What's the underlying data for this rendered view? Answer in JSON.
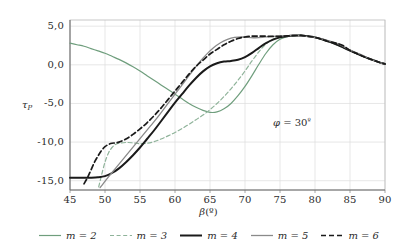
{
  "chart_data": {
    "type": "line",
    "title": "",
    "xlabel": "β(°)",
    "ylabel": "τP",
    "xlim": [
      45,
      90
    ],
    "ylim": [
      -16.2,
      5.8
    ],
    "xticks": [
      "45",
      "50",
      "55",
      "60",
      "65",
      "70",
      "75",
      "80",
      "85",
      "90"
    ],
    "xtick_values": [
      45,
      50,
      55,
      60,
      65,
      70,
      75,
      80,
      85,
      90
    ],
    "yticks": [
      "5,0",
      "0,0",
      "-5,0",
      "-10,0",
      "-15,0"
    ],
    "ytick_values": [
      5,
      0,
      -5,
      -10,
      -15
    ],
    "grid": true,
    "legend_position": "bottom",
    "annotations": [
      {
        "text": "φ = 30º",
        "x": 78.5,
        "y": -7.2
      }
    ],
    "series": [
      {
        "name": "m = 2",
        "label": "m = 2",
        "color": "#6f9e7d",
        "style": "solid",
        "width": 1.2,
        "x": [
          45,
          46,
          47,
          48,
          49,
          50,
          51,
          52,
          53,
          54,
          55,
          56,
          57,
          58,
          59,
          60,
          61,
          62,
          63,
          64,
          65,
          66,
          67,
          68,
          69,
          70,
          71,
          72,
          73,
          74,
          75,
          76,
          77,
          78,
          79,
          80,
          81,
          82,
          83,
          84,
          85,
          86,
          87,
          88,
          89,
          90
        ],
        "y": [
          2.8,
          2.6,
          2.4,
          2.1,
          1.8,
          1.5,
          1.1,
          0.7,
          0.25,
          -0.25,
          -0.8,
          -1.4,
          -2.0,
          -2.6,
          -3.2,
          -3.8,
          -4.4,
          -5.0,
          -5.5,
          -5.9,
          -6.15,
          -6.1,
          -5.7,
          -5.0,
          -4.0,
          -2.8,
          -1.4,
          0.1,
          1.5,
          2.6,
          3.3,
          3.65,
          3.78,
          3.8,
          3.7,
          3.55,
          3.3,
          3.0,
          2.65,
          2.25,
          1.85,
          1.45,
          1.05,
          0.7,
          0.38,
          0.1
        ]
      },
      {
        "name": "m = 3",
        "label": "m = 3",
        "color": "#8fb39a",
        "style": "dashed",
        "width": 1.2,
        "x": [
          49.1,
          49.5,
          50,
          50.5,
          51,
          51.5,
          52,
          53,
          54,
          55,
          56,
          57,
          58,
          59,
          60,
          61,
          62,
          63,
          64,
          65,
          66,
          67,
          68,
          69,
          70,
          71,
          72,
          73,
          74,
          75,
          76,
          77,
          78,
          79,
          80,
          81,
          82,
          83,
          84,
          85,
          86,
          87,
          88,
          89,
          90
        ],
        "y": [
          -15.8,
          -14.3,
          -12.6,
          -11.4,
          -10.7,
          -10.3,
          -10.15,
          -10.05,
          -10.1,
          -10.2,
          -10.15,
          -9.95,
          -9.6,
          -9.2,
          -8.75,
          -8.25,
          -7.7,
          -7.1,
          -6.5,
          -5.8,
          -5.0,
          -4.1,
          -3.1,
          -2.0,
          -0.8,
          0.5,
          1.7,
          2.7,
          3.3,
          3.6,
          3.72,
          3.78,
          3.8,
          3.7,
          3.55,
          3.3,
          3.0,
          2.65,
          2.25,
          1.85,
          1.45,
          1.05,
          0.7,
          0.38,
          0.1
        ]
      },
      {
        "name": "m = 4",
        "label": "m = 4",
        "color": "#1a1a1a",
        "style": "solid",
        "width": 2.0,
        "x": [
          45,
          46,
          47,
          48,
          49,
          50,
          51,
          52,
          53,
          54,
          55,
          56,
          57,
          58,
          59,
          60,
          61,
          62,
          63,
          64,
          65,
          66,
          67,
          68,
          69,
          70,
          71,
          72,
          73,
          74,
          75,
          76,
          77,
          78,
          79,
          80,
          81,
          82,
          83,
          84,
          85,
          86,
          87,
          88,
          89,
          90
        ],
        "y": [
          -14.6,
          -14.6,
          -14.6,
          -14.6,
          -14.55,
          -14.4,
          -14.0,
          -13.4,
          -12.6,
          -11.7,
          -10.7,
          -9.6,
          -8.5,
          -7.3,
          -6.1,
          -4.9,
          -3.8,
          -2.7,
          -1.7,
          -0.85,
          -0.2,
          0.2,
          0.42,
          0.5,
          0.65,
          1.0,
          1.55,
          2.2,
          2.8,
          3.25,
          3.55,
          3.7,
          3.78,
          3.8,
          3.7,
          3.55,
          3.3,
          3.0,
          2.65,
          2.25,
          1.85,
          1.45,
          1.05,
          0.7,
          0.38,
          0.1
        ]
      },
      {
        "name": "m = 5",
        "label": "m = 5",
        "color": "#8a8a8a",
        "style": "solid",
        "width": 1.3,
        "x": [
          49.3,
          49.8,
          50.5,
          51.5,
          52.5,
          53.5,
          54.5,
          55.5,
          56.5,
          57.5,
          58.5,
          59.5,
          60.5,
          61.5,
          62.5,
          63.5,
          64.5,
          65.5,
          66.5,
          67.5,
          68.5,
          69.5,
          70.5,
          71.5,
          72.5,
          73.5,
          74.5,
          75.5,
          76.5,
          77.5,
          78.5,
          79.5,
          80.5,
          82,
          83.5,
          85,
          86.5,
          88,
          89,
          90
        ],
        "y": [
          -15.9,
          -15.3,
          -14.5,
          -13.4,
          -12.3,
          -11.2,
          -10.1,
          -9.0,
          -7.9,
          -6.8,
          -5.6,
          -4.4,
          -3.2,
          -2.0,
          -0.8,
          0.35,
          1.35,
          2.2,
          2.85,
          3.3,
          3.55,
          3.6,
          3.55,
          3.5,
          3.55,
          3.65,
          3.72,
          3.76,
          3.79,
          3.8,
          3.72,
          3.6,
          3.45,
          3.1,
          2.65,
          1.9,
          1.35,
          0.7,
          0.38,
          0.1
        ]
      },
      {
        "name": "m = 6",
        "label": "m = 6",
        "color": "#1a1a1a",
        "style": "dashed",
        "width": 1.7,
        "x": [
          47.0,
          47.5,
          48,
          48.5,
          49,
          49.5,
          50,
          50.5,
          51,
          51.5,
          52,
          53,
          54,
          55,
          56,
          57,
          58,
          59,
          60,
          61,
          62,
          63,
          64,
          65,
          66,
          67,
          68,
          69,
          70,
          71,
          72,
          73,
          74,
          75,
          76,
          77,
          78,
          79,
          80,
          81,
          82,
          83,
          84,
          85,
          86,
          87,
          88,
          89,
          90
        ],
        "y": [
          -15.4,
          -14.6,
          -13.6,
          -12.6,
          -11.8,
          -11.1,
          -10.6,
          -10.3,
          -10.15,
          -10.1,
          -10.0,
          -9.6,
          -9.0,
          -8.3,
          -7.5,
          -6.6,
          -5.6,
          -4.5,
          -3.4,
          -2.3,
          -1.2,
          -0.2,
          0.6,
          1.4,
          2.0,
          2.6,
          3.05,
          3.4,
          3.6,
          3.7,
          3.72,
          3.7,
          3.68,
          3.7,
          3.74,
          3.78,
          3.8,
          3.7,
          3.55,
          3.3,
          3.0,
          2.8,
          2.5,
          1.85,
          1.45,
          1.05,
          0.7,
          0.38,
          0.1
        ]
      }
    ]
  },
  "axes": {
    "ylabel_main": "τ",
    "ylabel_sub": "P",
    "xlabel_symbol": "β",
    "xlabel_unit": "(º)"
  },
  "annotation": {
    "symbol": "φ",
    "equals": " = 30",
    "degree": "º"
  },
  "legend": {
    "items": [
      {
        "label": "m = 2"
      },
      {
        "label": "m = 3"
      },
      {
        "label": "m = 4"
      },
      {
        "label": "m = 5"
      },
      {
        "label": "m = 6"
      }
    ]
  }
}
